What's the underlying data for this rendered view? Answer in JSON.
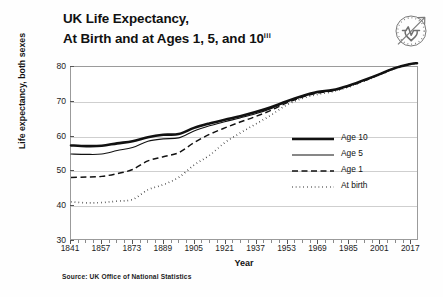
{
  "figure": {
    "title_line1": "UK Life Expectancy,",
    "title_line2": "At Birth and at Ages 1, 5, and 10",
    "title_superscript": "iii",
    "source": "Source: UK Office of National Statistics",
    "logo_icon": "clock-heartbeat-arrow-icon"
  },
  "chart_data": {
    "type": "line",
    "title": "UK Life Expectancy, At Birth and at Ages 1, 5, and 10",
    "xlabel": "Year",
    "ylabel": "Life expectancy, both sexes",
    "xlim": [
      1841,
      2021
    ],
    "ylim": [
      30,
      80
    ],
    "xticks": [
      1841,
      1857,
      1873,
      1889,
      1905,
      1921,
      1937,
      1953,
      1969,
      1985,
      2001,
      2017
    ],
    "yticks": [
      30,
      40,
      50,
      60,
      70,
      80
    ],
    "grid": "horizontal",
    "legend_position": "center-right",
    "x": [
      1841,
      1849,
      1857,
      1865,
      1873,
      1881,
      1889,
      1897,
      1905,
      1913,
      1921,
      1929,
      1937,
      1945,
      1953,
      1961,
      1969,
      1977,
      1985,
      1993,
      2001,
      2009,
      2017,
      2021
    ],
    "series": [
      {
        "name": "Age 10",
        "style": "thick-solid",
        "color": "#111111",
        "values": [
          57.2,
          57.0,
          57.1,
          57.8,
          58.4,
          59.6,
          60.3,
          60.5,
          62.3,
          63.6,
          64.7,
          65.7,
          66.9,
          68.3,
          70.0,
          71.5,
          72.7,
          73.3,
          74.5,
          76.1,
          77.8,
          79.6,
          80.8,
          81.1
        ]
      },
      {
        "name": "Age 5",
        "style": "thin-solid",
        "color": "#111111",
        "values": [
          54.7,
          54.6,
          54.7,
          55.7,
          56.6,
          58.4,
          59.1,
          59.4,
          61.4,
          62.9,
          64.1,
          65.2,
          66.4,
          67.9,
          69.8,
          71.4,
          72.6,
          73.2,
          74.4,
          76.0,
          77.8,
          79.6,
          80.8,
          81.1
        ]
      },
      {
        "name": "Age 1",
        "style": "dashed",
        "color": "#111111",
        "values": [
          47.9,
          48.0,
          48.2,
          49.0,
          50.2,
          52.7,
          53.9,
          55.1,
          58.0,
          60.4,
          62.3,
          64.0,
          65.6,
          67.4,
          69.5,
          71.2,
          72.4,
          73.1,
          74.3,
          75.9,
          77.7,
          79.5,
          80.8,
          81.1
        ]
      },
      {
        "name": "At birth",
        "style": "dotted",
        "color": "#111111",
        "values": [
          40.8,
          40.5,
          40.6,
          41.0,
          41.5,
          44.3,
          45.8,
          47.9,
          51.5,
          54.3,
          58.0,
          60.8,
          63.4,
          66.0,
          68.9,
          70.8,
          72.0,
          72.8,
          74.1,
          75.8,
          77.6,
          79.4,
          80.7,
          81.0
        ]
      }
    ]
  },
  "legend": {
    "items": [
      {
        "label": "Age 10",
        "style": "thick-solid"
      },
      {
        "label": "Age 5",
        "style": "thin-solid"
      },
      {
        "label": "Age 1",
        "style": "dashed"
      },
      {
        "label": "At birth",
        "style": "dotted"
      }
    ]
  }
}
